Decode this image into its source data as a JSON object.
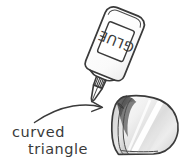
{
  "figure": {
    "background_color": "#ffffff",
    "ink_color": "#3a3a3a"
  },
  "annotation": {
    "line1": "curved",
    "line2": "triangle",
    "arrow_name": "curved-arrow-pointer"
  },
  "glue_bottle": {
    "label_text": "GLUE",
    "label_rotation_degrees": 180,
    "body_name": "glue-bottle-body",
    "cap_name": "glue-bottle-ribbed-collar",
    "nozzle_name": "glue-bottle-nozzle-tip",
    "tilt_degrees": 22
  },
  "shape": {
    "name": "curved-triangle-solid",
    "highlight_color": "#f2f2f2",
    "midtone_color": "#d4d4d4",
    "shadow_color": "#5d5d5d"
  }
}
